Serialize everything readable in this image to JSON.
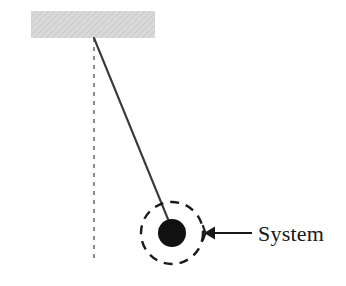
{
  "figure": {
    "background_color": "#ffffff",
    "width": 346,
    "height": 286
  },
  "ceiling": {
    "name": "ceiling-support-block",
    "fill_color": "#d6d6d6",
    "x": 31,
    "y": 11,
    "width": 124,
    "height": 27
  },
  "pivot": {
    "name": "pivot-point",
    "x": 94,
    "y": 38
  },
  "vertical_reference": {
    "name": "vertical-dashed-reference-line",
    "color": "#6e6e70",
    "x": 94,
    "y_top": 38,
    "y_bottom": 263,
    "dash": "4 5",
    "stroke_width": 1.6
  },
  "string": {
    "name": "pendulum-string",
    "color": "#3a3a3c",
    "x1": 94,
    "y1": 38,
    "x2": 172,
    "y2": 229,
    "stroke_width": 2.1
  },
  "bob": {
    "name": "pendulum-bob",
    "fill_color": "#111112",
    "cx": 172,
    "cy": 233,
    "r": 14
  },
  "system_boundary": {
    "name": "system-boundary-dashed-circle",
    "color": "#1a1a1c",
    "cx": 172,
    "cy": 233,
    "r": 31,
    "dash": "9 7",
    "stroke_width": 2.4
  },
  "pointer": {
    "name": "system-pointer-arrow",
    "color": "#17181a",
    "tail_x": 252,
    "tip_x": 204,
    "y": 233,
    "stroke_width": 2.2,
    "head_width": 13,
    "head_height": 11
  },
  "label": {
    "name": "system-label",
    "text": "System",
    "x": 258,
    "y": 241,
    "color": "#17181a",
    "font_size": 22
  }
}
